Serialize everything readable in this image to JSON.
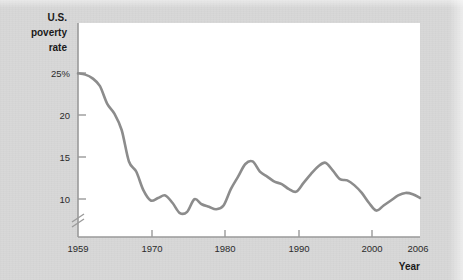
{
  "chart_data": {
    "type": "line",
    "title": "",
    "subtitle": "",
    "ylabel_lines": [
      "U.S.",
      "poverty",
      "rate"
    ],
    "xlabel": "Year",
    "x": [
      1959,
      1960,
      1961,
      1962,
      1963,
      1964,
      1965,
      1966,
      1967,
      1968,
      1969,
      1970,
      1971,
      1972,
      1973,
      1974,
      1975,
      1976,
      1977,
      1978,
      1979,
      1980,
      1981,
      1982,
      1983,
      1984,
      1985,
      1986,
      1987,
      1988,
      1989,
      1990,
      1991,
      1992,
      1993,
      1994,
      1995,
      1996,
      1997,
      1998,
      1999,
      2000,
      2001,
      2002,
      2003,
      2004,
      2005,
      2006
    ],
    "series": [
      {
        "name": "U.S. poverty rate",
        "color": "#8c8c8c",
        "values": [
          22.2,
          22.1,
          21.8,
          21.2,
          19.8,
          19.0,
          17.7,
          15.2,
          14.4,
          12.9,
          12.1,
          12.3,
          12.5,
          11.9,
          11.1,
          11.2,
          12.2,
          11.8,
          11.6,
          11.4,
          11.7,
          13.0,
          14.0,
          15.0,
          15.2,
          14.4,
          14.0,
          13.6,
          13.4,
          13.0,
          12.8,
          13.5,
          14.2,
          14.8,
          15.1,
          14.5,
          13.8,
          13.7,
          13.3,
          12.7,
          11.9,
          11.3,
          11.7,
          12.1,
          12.5,
          12.7,
          12.6,
          12.3
        ]
      }
    ],
    "xlim": [
      1959,
      2006
    ],
    "ylim": [
      9.2,
      26.2
    ],
    "xticks": [
      1959,
      1970,
      1980,
      1990,
      2000,
      2006
    ],
    "xtick_labels": [
      "1959",
      "1970",
      "1980",
      "1990",
      "2000",
      "2006"
    ],
    "yticks": [
      25,
      20,
      15,
      10
    ],
    "ytick_labels": [
      "25%",
      "20",
      "15",
      "10"
    ],
    "grid": false,
    "legend": "none",
    "axis_break": {
      "axis": "y",
      "label": "axis-break-mark",
      "present": true
    },
    "colors": {
      "line": "#8c8c8c",
      "axis": "#9a9a9a",
      "plot_background": "#ffffff",
      "page_background": "#d8d8d8",
      "text": "#1a1a1a"
    }
  }
}
